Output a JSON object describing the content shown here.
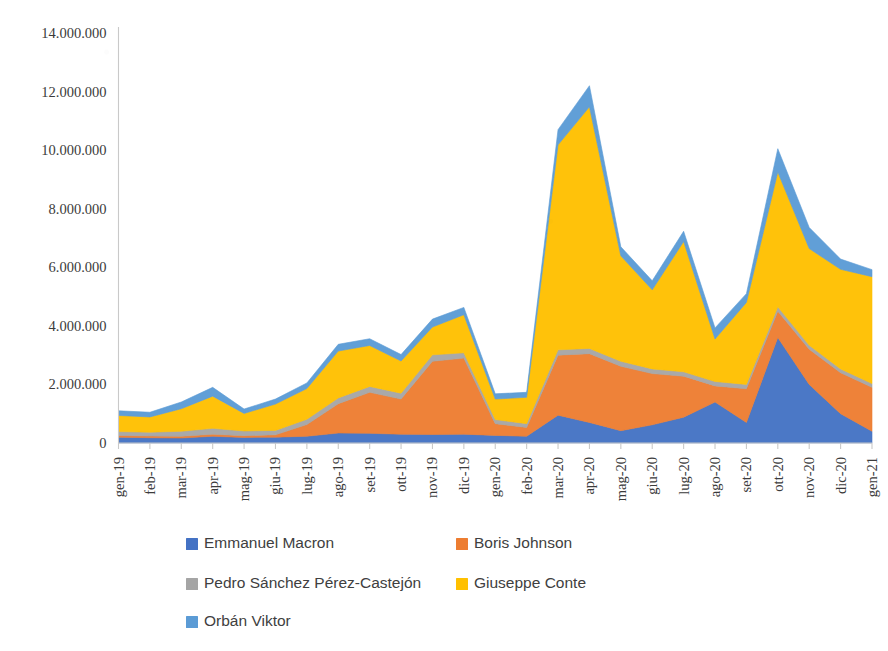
{
  "chart_data": {
    "type": "area",
    "stacked": true,
    "title": "",
    "subtitle": "",
    "xlabel": "",
    "ylabel": "",
    "grid": false,
    "legend_position": "bottom",
    "ylim": [
      0,
      14000000
    ],
    "ytick_labels": [
      "0",
      "2.000.000",
      "4.000.000",
      "6.000.000",
      "8.000.000",
      "10.000.000",
      "12.000.000",
      "14.000.000"
    ],
    "ytick_values": [
      0,
      2000000,
      4000000,
      6000000,
      8000000,
      10000000,
      12000000,
      14000000
    ],
    "categories": [
      "gen-19",
      "feb-19",
      "mar-19",
      "apr-19",
      "mag-19",
      "giu-19",
      "lug-19",
      "ago-19",
      "set-19",
      "ott-19",
      "nov-19",
      "dic-19",
      "gen-20",
      "feb-20",
      "mar-20",
      "apr-20",
      "mag-20",
      "giu-20",
      "lug-20",
      "ago-20",
      "set-20",
      "ott-20",
      "nov-20",
      "dic-20",
      "gen-21"
    ],
    "series": [
      {
        "name": "Emmanuel Macron",
        "color": "#4472C4",
        "values": [
          200000,
          180000,
          170000,
          230000,
          190000,
          200000,
          230000,
          340000,
          330000,
          300000,
          290000,
          300000,
          260000,
          230000,
          950000,
          700000,
          420000,
          620000,
          880000,
          1400000,
          700000,
          3600000,
          2000000,
          1000000,
          400000
        ]
      },
      {
        "name": "Boris Johnson",
        "color": "#ED7D31",
        "values": [
          60000,
          60000,
          60000,
          70000,
          60000,
          80000,
          400000,
          1000000,
          1400000,
          1200000,
          2500000,
          2600000,
          400000,
          300000,
          2050000,
          2350000,
          2200000,
          1750000,
          1400000,
          550000,
          1150000,
          900000,
          1200000,
          1400000,
          1500000
        ]
      },
      {
        "name": "Pedro Sánchez Pérez-Castejón",
        "color": "#A5A5A5",
        "values": [
          130000,
          130000,
          170000,
          200000,
          160000,
          150000,
          180000,
          200000,
          200000,
          200000,
          220000,
          180000,
          140000,
          130000,
          180000,
          180000,
          170000,
          160000,
          150000,
          150000,
          150000,
          150000,
          140000,
          130000,
          130000
        ]
      },
      {
        "name": "Giuseppe Conte",
        "color": "#FFC000",
        "values": [
          550000,
          520000,
          770000,
          1100000,
          600000,
          900000,
          1050000,
          1600000,
          1400000,
          1100000,
          950000,
          1300000,
          700000,
          900000,
          7000000,
          8250000,
          3600000,
          2700000,
          4450000,
          1450000,
          2800000,
          4600000,
          3300000,
          3400000,
          3650000
        ]
      },
      {
        "name": "Orbán Viktor",
        "color": "#5B9BD5",
        "values": [
          160000,
          160000,
          230000,
          300000,
          150000,
          170000,
          190000,
          230000,
          230000,
          220000,
          270000,
          250000,
          180000,
          170000,
          520000,
          720000,
          310000,
          310000,
          350000,
          380000,
          300000,
          800000,
          720000,
          350000,
          240000
        ]
      }
    ]
  },
  "legend": {
    "entries": [
      {
        "label": "Emmanuel Macron",
        "color": "#4472C4"
      },
      {
        "label": "Boris Johnson",
        "color": "#ED7D31"
      },
      {
        "label": "Pedro Sánchez Pérez-Castejón",
        "color": "#A5A5A5"
      },
      {
        "label": "Giuseppe Conte",
        "color": "#FFC000"
      },
      {
        "label": "Orbán Viktor",
        "color": "#5B9BD5"
      }
    ]
  }
}
